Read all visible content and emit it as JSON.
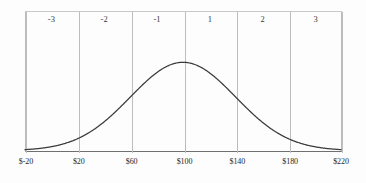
{
  "chart_data": {
    "type": "line",
    "title": "",
    "subtitle": "",
    "xlabel": "",
    "ylabel": "",
    "grid": true,
    "legend": null,
    "curve": "normal-distribution",
    "mean": 100,
    "sigma": 40,
    "xlim": [
      -20,
      220
    ],
    "ylim": [
      0,
      1
    ],
    "x_tick_labels": [
      "$-20",
      "$20",
      "$60",
      "$100",
      "$140",
      "$180",
      "$220"
    ],
    "x_tick_values": [
      -20,
      20,
      60,
      100,
      140,
      180,
      220
    ],
    "band_labels": [
      "-3",
      "-2",
      "-1",
      "1",
      "2",
      "3"
    ],
    "band_values": [
      -3,
      -2,
      -1,
      1,
      2,
      3
    ],
    "x": [
      -20,
      0,
      20,
      40,
      60,
      80,
      100,
      120,
      140,
      160,
      180,
      200,
      220
    ],
    "values": [
      0.011,
      0.044,
      0.135,
      0.325,
      0.607,
      0.882,
      1.0,
      0.882,
      0.607,
      0.325,
      0.135,
      0.044,
      0.011
    ],
    "colors": {
      "curve": "#3a3a3a",
      "gridline": "#bdbdbd",
      "axis": "#6f6f6f",
      "text": "#262626",
      "background": "#fdfdfd"
    }
  }
}
